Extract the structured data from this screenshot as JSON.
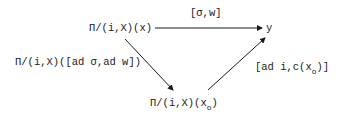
{
  "diagram": {
    "type": "commutative-diagram",
    "nodes": {
      "top_left": {
        "prefix": "Π/(i,X)(x)",
        "label": "Π/(i,X)(x)"
      },
      "top_right": {
        "label": "y"
      },
      "bottom": {
        "prefix": "Π/(i,X)(x",
        "subscript": "o",
        "suffix": ")"
      }
    },
    "edges": {
      "top": {
        "label": "[σ,w]",
        "from": "top_left",
        "to": "top_right"
      },
      "left_diag": {
        "label": "Π/(i,X)([ad σ,ad w])",
        "from": "top_left",
        "to": "bottom"
      },
      "right_diag": {
        "prefix": "[ad i,c(x",
        "subscript": "o",
        "suffix": ")]",
        "from": "bottom",
        "to": "top_right"
      }
    },
    "colors": {
      "ink": "#1a1a1a",
      "background": "#ffffff"
    }
  }
}
